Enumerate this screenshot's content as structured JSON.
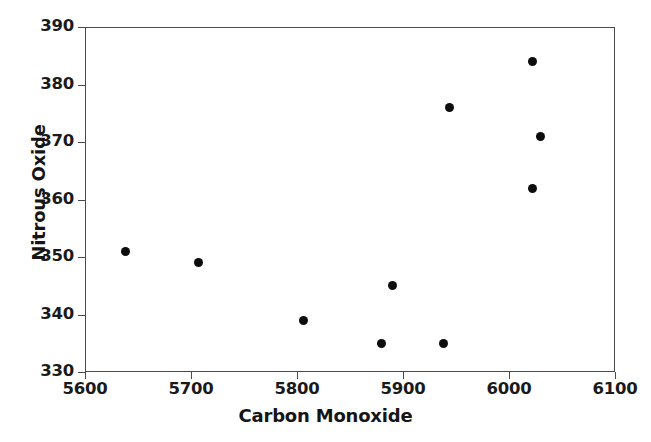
{
  "chart_data": {
    "type": "scatter",
    "title": "",
    "xlabel": "Carbon Monoxide",
    "ylabel": "Nitrous Oxide",
    "xlim": [
      5600,
      6100
    ],
    "ylim": [
      330,
      390
    ],
    "xticks": [
      5600,
      5700,
      5800,
      5900,
      6000,
      6100
    ],
    "yticks": [
      330,
      340,
      350,
      360,
      370,
      380,
      390
    ],
    "xtick_labels": [
      "5600",
      "5700",
      "5800",
      "5900",
      "6000",
      "6100"
    ],
    "ytick_labels": [
      "330",
      "340",
      "350",
      "360",
      "370",
      "380",
      "390"
    ],
    "grid": false,
    "legend": null,
    "marker": "filled-circle",
    "marker_color": "#0d0d0d",
    "frame_color": "#4a4a4a",
    "background": "#ffffff",
    "series": [
      {
        "name": "Nitrous Oxide vs Carbon Monoxide",
        "x": [
          5638,
          5707,
          5806,
          5880,
          5890,
          5938,
          5944,
          6022,
          6022,
          6030
        ],
        "y": [
          351,
          349,
          339,
          335,
          345,
          335,
          376,
          384,
          362,
          371
        ]
      }
    ],
    "points": [
      {
        "x": 5638,
        "y": 351
      },
      {
        "x": 5707,
        "y": 349
      },
      {
        "x": 5806,
        "y": 339
      },
      {
        "x": 5880,
        "y": 335
      },
      {
        "x": 5890,
        "y": 345
      },
      {
        "x": 5938,
        "y": 335
      },
      {
        "x": 5944,
        "y": 376
      },
      {
        "x": 6022,
        "y": 384
      },
      {
        "x": 6022,
        "y": 362
      },
      {
        "x": 6030,
        "y": 371
      }
    ],
    "n_points": 10
  }
}
